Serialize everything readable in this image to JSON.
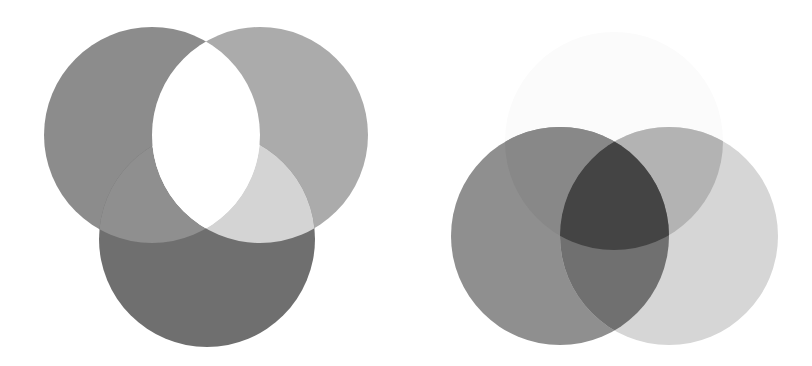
{
  "diagrams": [
    {
      "name": "additive-three-circle-venn",
      "circles": [
        {
          "id": "A",
          "cx": 152,
          "cy": 135,
          "r": 108
        },
        {
          "id": "B",
          "cx": 260,
          "cy": 135,
          "r": 108
        },
        {
          "id": "C",
          "cx": 207,
          "cy": 239,
          "r": 108
        }
      ],
      "colors": {
        "A": "#8c8c8c",
        "B": "#ababab",
        "C": "#6f6f6f",
        "AC": "#8f8f8f",
        "BC": "#d4d4d4",
        "AB": "#ffffff",
        "ABC": "#ffffff"
      }
    },
    {
      "name": "subtractive-three-circle-venn",
      "circles": [
        {
          "id": "T",
          "cx": 614,
          "cy": 141,
          "r": 109
        },
        {
          "id": "L",
          "cx": 560,
          "cy": 236,
          "r": 109
        },
        {
          "id": "R",
          "cx": 669,
          "cy": 236,
          "r": 109
        }
      ],
      "colors": {
        "T": "#fbfbfb",
        "L": "#8f8f8f",
        "R": "#d6d6d6",
        "LT": "#888888",
        "RT": "#b3b3b3",
        "LR": "#707070",
        "LRT": "#444444"
      }
    }
  ]
}
